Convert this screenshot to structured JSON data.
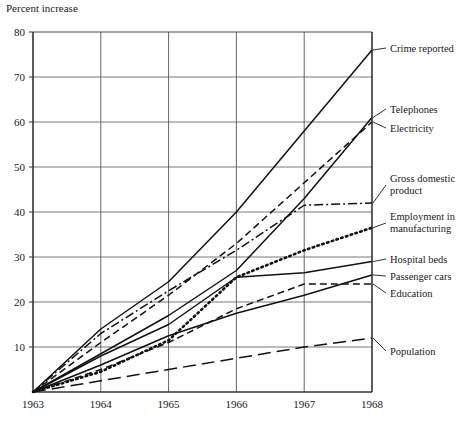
{
  "chart_data": {
    "type": "line",
    "title": "",
    "ylabel": "Percent increase",
    "xlabel": "",
    "x": [
      1963,
      1964,
      1965,
      1966,
      1967,
      1968
    ],
    "xtick_labels": [
      "1963",
      "1964",
      "1965",
      "1966",
      "1967",
      "1968"
    ],
    "ytick_labels": [
      "10",
      "20",
      "30",
      "40",
      "50",
      "60",
      "70",
      "80"
    ],
    "ytick_values": [
      10,
      20,
      30,
      40,
      50,
      60,
      70,
      80
    ],
    "xlim": [
      1963,
      1968
    ],
    "ylim": [
      0,
      80
    ],
    "grid": true,
    "legend_position": "right-inline-labels",
    "series": [
      {
        "name": "Crime reported",
        "style": "solid",
        "values": [
          0,
          14,
          24.5,
          40,
          58,
          76
        ],
        "label": "Crime reported",
        "label_y": 76
      },
      {
        "name": "Telephones",
        "style": "solid",
        "values": [
          0,
          8.5,
          17,
          27,
          43,
          61
        ],
        "label": "Telephones",
        "label_y": 61
      },
      {
        "name": "Electricity",
        "style": "dashed",
        "values": [
          0,
          11,
          21.5,
          33,
          46.5,
          60
        ],
        "label": "Electricity",
        "label_y": 60
      },
      {
        "name": "Gross domestic product",
        "style": "dashdot",
        "values": [
          0,
          13,
          22.5,
          31.5,
          41.5,
          42
        ],
        "label": "Gross domestic product",
        "label_y": 42
      },
      {
        "name": "Employment in manufacturing",
        "style": "dotted",
        "values": [
          0,
          4.5,
          11.5,
          25.5,
          31.5,
          36.5
        ],
        "label": "Employment in manufacturing",
        "label_y": 36.5
      },
      {
        "name": "Hospital beds",
        "style": "solid",
        "values": [
          0,
          8,
          15,
          25.5,
          26.5,
          29
        ],
        "label": "Hospital beds",
        "label_y": 29
      },
      {
        "name": "Passenger cars",
        "style": "solid",
        "values": [
          0,
          6,
          12.5,
          17.5,
          21.5,
          26
        ],
        "label": "Passenger cars",
        "label_y": 26
      },
      {
        "name": "Education",
        "style": "dashed",
        "values": [
          0,
          5,
          11,
          18.5,
          24,
          24
        ],
        "label": "Education",
        "label_y": 24
      },
      {
        "name": "Population",
        "style": "longdash",
        "values": [
          0,
          2.5,
          5,
          7.5,
          10,
          12
        ],
        "label": "Population",
        "label_y": 12
      }
    ]
  }
}
